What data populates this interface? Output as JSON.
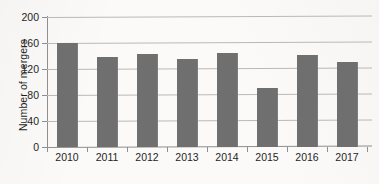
{
  "chart_data": {
    "type": "bar",
    "title": "",
    "subtitle": "",
    "xlabel": "",
    "ylabel": "Number of mergers",
    "categories": [
      "2010",
      "2011",
      "2012",
      "2013",
      "2014",
      "2015",
      "2016",
      "2017"
    ],
    "values": [
      160,
      139,
      143,
      135,
      144,
      91,
      142,
      131
    ],
    "series": [
      {
        "name": "Number of mergers",
        "values": [
          160,
          139,
          143,
          135,
          144,
          91,
          142,
          131
        ]
      }
    ],
    "ylim": [
      0,
      200
    ],
    "y_ticks": [
      0,
      40,
      80,
      120,
      160,
      200
    ],
    "y_tick_labels": [
      "0",
      "40",
      "80",
      "120",
      "160",
      "200"
    ],
    "x_tick_labels": [
      "2010",
      "2011",
      "2012",
      "2013",
      "2014",
      "2015",
      "2016",
      "2017"
    ],
    "grid": true,
    "grid_axis": "y",
    "legend": false,
    "legend_position": "none",
    "bar_color": "#6f6f6f",
    "gridline_color": "#b9b9b9",
    "axis_color": "#8f8f8f",
    "background_color": "#fbfaf8",
    "text_color": "#1f1f1f",
    "annotations": []
  }
}
